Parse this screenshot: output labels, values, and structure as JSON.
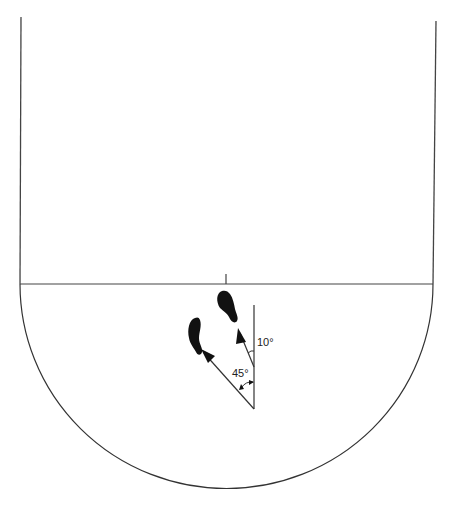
{
  "diagram": {
    "colors": {
      "line": "#333333",
      "foot": "#111111",
      "background": "#ffffff"
    },
    "labels": {
      "angle_large": "45°",
      "angle_small": "10°"
    },
    "elements": {
      "left_wall": "left-boundary-line",
      "right_wall": "right-boundary-line",
      "baseline": "horizontal-line",
      "center_tick": "center-tick-mark",
      "semicircle": "semicircle-arc",
      "reference_line": "vertical-reference-line",
      "arrow_45": "direction-arrow-45-degrees",
      "arrow_10": "direction-arrow-10-degrees",
      "left_foot": "left-footprint",
      "right_foot": "right-footprint"
    }
  }
}
